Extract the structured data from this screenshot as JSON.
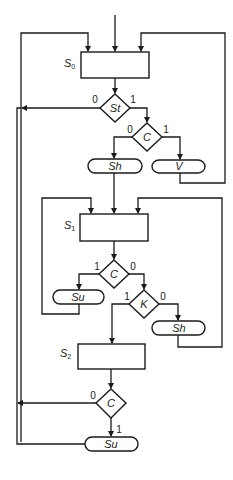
{
  "diagram": {
    "type": "ASM chart (algorithmic state machine)",
    "states": [
      {
        "id": "S0",
        "label": "S",
        "subscript": "0"
      },
      {
        "id": "S1",
        "label": "S",
        "subscript": "1"
      },
      {
        "id": "S2",
        "label": "S",
        "subscript": "2"
      }
    ],
    "decisions": [
      {
        "id": "d_st",
        "label": "St",
        "branch_left": "0",
        "branch_right": "1"
      },
      {
        "id": "d_c1",
        "label": "C",
        "branch_left": "0",
        "branch_right": "1"
      },
      {
        "id": "d_c2",
        "label": "C",
        "branch_left": "1",
        "branch_right": "0"
      },
      {
        "id": "d_k",
        "label": "K",
        "branch_left": "1",
        "branch_right": "0"
      },
      {
        "id": "d_c3",
        "label": "C",
        "branch_left": "0",
        "branch_down": "1"
      }
    ],
    "outputs": [
      {
        "id": "o_sh1",
        "label": "Sh"
      },
      {
        "id": "o_v",
        "label": "V"
      },
      {
        "id": "o_su1",
        "label": "Su"
      },
      {
        "id": "o_sh2",
        "label": "Sh"
      },
      {
        "id": "o_su2",
        "label": "Su"
      }
    ]
  }
}
